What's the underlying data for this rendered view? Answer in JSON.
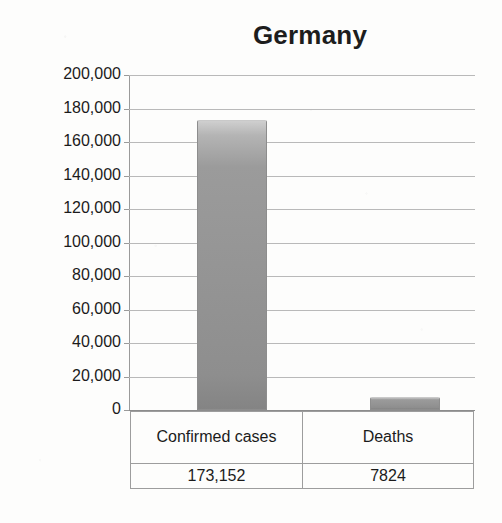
{
  "chart_data": {
    "type": "bar",
    "title": "Germany",
    "xlabel": "",
    "ylabel": "Total Number",
    "categories": [
      "Confirmed cases",
      "Deaths"
    ],
    "values": [
      173152,
      7824
    ],
    "value_labels": [
      "173,152",
      "7824"
    ],
    "ylim": [
      0,
      200000
    ],
    "ytick_step": 20000,
    "yticks": [
      200000,
      180000,
      160000,
      140000,
      120000,
      100000,
      80000,
      60000,
      40000,
      20000,
      0
    ],
    "ytick_labels": [
      "200,000",
      "180,000",
      "160,000",
      "140,000",
      "120,000",
      "100,000",
      "80,000",
      "60,000",
      "40,000",
      "20,000",
      "0"
    ],
    "grid": true,
    "grid_axis": "y",
    "legend": false,
    "data_table": {
      "visible": true,
      "header": [
        "Confirmed cases",
        "Deaths"
      ],
      "rows": [
        [
          "173,152",
          "7824"
        ]
      ]
    },
    "colors": {
      "bar_fill_top": "#cfcfcf",
      "bar_fill_mid": "#949494",
      "bar_fill_bottom": "#848484",
      "bar_border": "#8d8d8d",
      "gridline": "#b9b9b9",
      "axis": "#8c8c8c",
      "text": "#1b1b1b",
      "background": "#fdfdfc"
    }
  }
}
